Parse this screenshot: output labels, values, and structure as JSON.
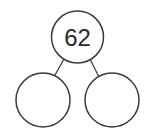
{
  "diagram": {
    "type": "number-bond",
    "whole": {
      "value": "62"
    },
    "parts": [
      {
        "value": ""
      },
      {
        "value": ""
      }
    ],
    "colors": {
      "stroke": "#3a3a3a",
      "text": "#2a2a2a",
      "background": "#ffffff"
    }
  }
}
